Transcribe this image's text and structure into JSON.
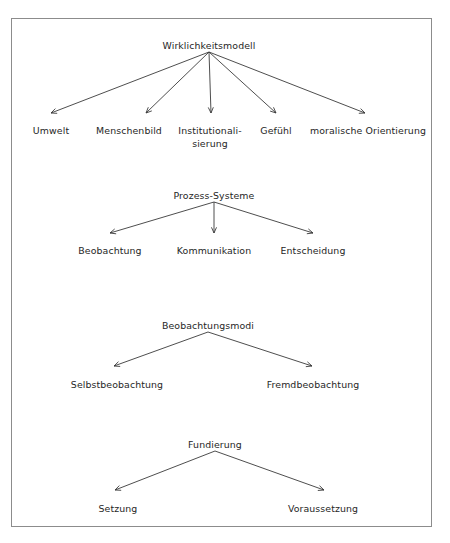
{
  "figure": {
    "type": "tree-diagram",
    "language": "de",
    "border_color": "#8c8c8c",
    "text_color": "#262626",
    "background_color": "#ffffff",
    "arrow_color": "#3a3a3a"
  },
  "clusters": [
    {
      "id": "wirklichkeitsmodell",
      "root": {
        "label": "Wirklichkeitsmodell",
        "x": 209,
        "y": 40
      },
      "apex": {
        "x": 209,
        "y": 52
      },
      "children": [
        {
          "label": "Umwelt",
          "x": 51,
          "y": 125,
          "tip_x": 51,
          "tip_y": 113
        },
        {
          "label": "Menschenbild",
          "x": 129,
          "y": 125,
          "tip_x": 146,
          "tip_y": 113
        },
        {
          "label": "Institutionali-\nsierung",
          "x": 210,
          "y": 125,
          "tip_x": 211,
          "tip_y": 113,
          "wrap": true
        },
        {
          "label": "Gefühl",
          "x": 276,
          "y": 125,
          "tip_x": 276,
          "tip_y": 113
        },
        {
          "label": "moralische Orientierung",
          "x": 368,
          "y": 125,
          "tip_x": 365,
          "tip_y": 113
        }
      ]
    },
    {
      "id": "prozess-systeme",
      "root": {
        "label": "Prozess-Systeme",
        "x": 214,
        "y": 190
      },
      "apex": {
        "x": 214,
        "y": 202
      },
      "children": [
        {
          "label": "Beobachtung",
          "x": 110,
          "y": 245,
          "tip_x": 110,
          "tip_y": 233
        },
        {
          "label": "Kommunikation",
          "x": 214,
          "y": 245,
          "tip_x": 214,
          "tip_y": 233
        },
        {
          "label": "Entscheidung",
          "x": 313,
          "y": 245,
          "tip_x": 313,
          "tip_y": 233
        }
      ]
    },
    {
      "id": "beobachtungsmodi",
      "root": {
        "label": "Beobachtungsmodi",
        "x": 208,
        "y": 320
      },
      "apex": {
        "x": 208,
        "y": 332
      },
      "children": [
        {
          "label": "Selbstbeobachtung",
          "x": 117,
          "y": 379,
          "tip_x": 114,
          "tip_y": 366
        },
        {
          "label": "Fremdbeobachtung",
          "x": 313,
          "y": 379,
          "tip_x": 312,
          "tip_y": 366
        }
      ]
    },
    {
      "id": "fundierung",
      "root": {
        "label": "Fundierung",
        "x": 215,
        "y": 439
      },
      "apex": {
        "x": 215,
        "y": 451
      },
      "children": [
        {
          "label": "Setzung",
          "x": 118,
          "y": 503,
          "tip_x": 115,
          "tip_y": 490
        },
        {
          "label": "Voraussetzung",
          "x": 323,
          "y": 503,
          "tip_x": 324,
          "tip_y": 490
        }
      ]
    }
  ]
}
